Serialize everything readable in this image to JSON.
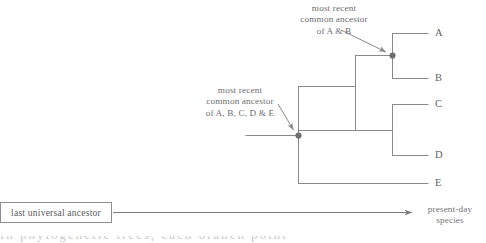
{
  "diagram": {
    "type": "phylogenetic-tree-cladogram",
    "annotations": {
      "mrca_ab": {
        "line1": "most recent",
        "line2": "common ancestor",
        "line3": "of A & B"
      },
      "mrca_all": {
        "line1": "most recent",
        "line2": "common ancestor",
        "line3": "of A, B, C, D & E"
      }
    },
    "tips": [
      {
        "label": "A"
      },
      {
        "label": "B"
      },
      {
        "label": "C"
      },
      {
        "label": "D"
      },
      {
        "label": "E"
      }
    ],
    "axis": {
      "origin_label": "last universal ancestor",
      "target_label_line1": "present-day",
      "target_label_line2": "species"
    },
    "clipped_caption": "In phylogenetic trees, each branch point",
    "colors": {
      "branch": "#8a8a8a",
      "node_marker": "#6e6e6e",
      "annotation_text": "#6d6d6d",
      "tip_text": "#5f5f5f",
      "box_border": "#8d8d8d",
      "axis_arrow": "#7c7c7c",
      "background": "#ffffff"
    }
  }
}
